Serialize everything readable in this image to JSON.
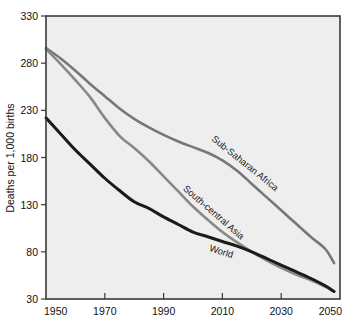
{
  "chart_data": {
    "type": "line",
    "title": "",
    "xlabel": "",
    "ylabel": "Deaths per 1,000 births",
    "xlim": [
      1950,
      2050
    ],
    "ylim": [
      30,
      330
    ],
    "grid": false,
    "legend_position": "inline-labels",
    "xticks": [
      1950,
      1970,
      1990,
      2010,
      2030,
      2050
    ],
    "xtick_labels": [
      "1950",
      "1970",
      "1990",
      "2010",
      "2030",
      "2050"
    ],
    "yticks": [
      30,
      80,
      130,
      180,
      230,
      280,
      330
    ],
    "ytick_labels": [
      "30",
      "80",
      "130",
      "180",
      "230",
      "280",
      "330"
    ],
    "x": [
      1950,
      1955,
      1960,
      1965,
      1970,
      1975,
      1980,
      1985,
      1990,
      1995,
      2000,
      2005,
      2010,
      2015,
      2020,
      2025,
      2030,
      2035,
      2040,
      2045,
      2048
    ],
    "series": [
      {
        "name": "Sub-Saharan Africa",
        "color": "#777777",
        "label_text": "Sub-Saharan Africa",
        "values": [
          296,
          285,
          272,
          258,
          245,
          232,
          221,
          212,
          204,
          197,
          191,
          185,
          177,
          166,
          152,
          138,
          124,
          110,
          96,
          83,
          68
        ]
      },
      {
        "name": "South-central Asia",
        "color": "#888888",
        "label_text": "South-central Asia",
        "values": [
          295,
          279,
          262,
          244,
          222,
          203,
          190,
          176,
          160,
          144,
          128,
          114,
          101,
          90,
          80,
          71,
          63,
          56,
          50,
          43,
          38
        ]
      },
      {
        "name": "World",
        "color": "#1a1a1a",
        "label_text": "World",
        "values": [
          222,
          205,
          188,
          173,
          158,
          145,
          133,
          126,
          117,
          109,
          101,
          96,
          91,
          86,
          80,
          73,
          66,
          59,
          52,
          44,
          38
        ]
      }
    ]
  },
  "axis": {
    "y_title": "Deaths per 1,000 births"
  }
}
